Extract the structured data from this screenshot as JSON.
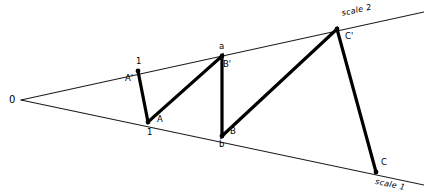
{
  "figure": {
    "background_color": "#ffffff",
    "ink_color": "#000000",
    "width": 424,
    "height": 196
  },
  "origin": {
    "label": "0",
    "x": 21,
    "y": 100
  },
  "scales": [
    {
      "name": "scale-1",
      "label": "scale 1",
      "label_x": 376,
      "label_y": 178,
      "from": {
        "x": 21,
        "y": 100
      },
      "to": {
        "x": 424,
        "y": 185
      }
    },
    {
      "name": "scale-2",
      "label": "scale 2",
      "label_x": 341,
      "label_y": 10,
      "from": {
        "x": 21,
        "y": 100
      },
      "to": {
        "x": 424,
        "y": 12
      }
    }
  ],
  "vertices": [
    {
      "name": "A-prime",
      "x": 138,
      "y": 71,
      "labels": [
        {
          "text": "1",
          "dx": -2,
          "dy": -14
        },
        {
          "text": "A'",
          "dx": -13,
          "dy": 3
        }
      ]
    },
    {
      "name": "A",
      "x": 148,
      "y": 122,
      "labels": [
        {
          "text": "A",
          "dx": 9,
          "dy": -7
        },
        {
          "text": "1",
          "dx": -1,
          "dy": 6
        }
      ]
    },
    {
      "name": "a",
      "x": 222,
      "y": 56,
      "labels": [
        {
          "text": "a",
          "dx": -3,
          "dy": -14
        },
        {
          "text": "B'",
          "dx": 1,
          "dy": 4
        }
      ]
    },
    {
      "name": "b",
      "x": 222,
      "y": 136,
      "labels": [
        {
          "text": "B",
          "dx": 8,
          "dy": -9
        },
        {
          "text": "b",
          "dx": -3,
          "dy": 4
        }
      ]
    },
    {
      "name": "C-prime",
      "x": 337,
      "y": 29,
      "labels": [
        {
          "text": "C'",
          "dx": 8,
          "dy": 3
        }
      ]
    },
    {
      "name": "C",
      "x": 376,
      "y": 172,
      "labels": [
        {
          "text": "C",
          "dx": 5,
          "dy": -14
        }
      ]
    }
  ],
  "zigzag_path": {
    "name": "construction-zigzag",
    "points": [
      {
        "x": 138,
        "y": 71
      },
      {
        "x": 148,
        "y": 122
      },
      {
        "x": 222,
        "y": 56
      },
      {
        "x": 222,
        "y": 136
      },
      {
        "x": 337,
        "y": 29
      },
      {
        "x": 376,
        "y": 172
      },
      {
        "x": 337,
        "y": 29
      }
    ]
  },
  "chart_data": {
    "type": "diagram",
    "origin_label": "0",
    "axis_labels": [
      "scale 1",
      "scale 2"
    ],
    "point_labels": [
      "1",
      "A'",
      "A",
      "1",
      "a",
      "B'",
      "B",
      "b",
      "C'",
      "C"
    ],
    "points": [
      {
        "id": "A'",
        "scale": "scale 2",
        "x": 138,
        "y": 71,
        "division": "1"
      },
      {
        "id": "A",
        "scale": "scale 1",
        "x": 148,
        "y": 122,
        "division": "1"
      },
      {
        "id": "B'",
        "scale": "scale 2",
        "x": 222,
        "y": 56,
        "division": "a"
      },
      {
        "id": "B",
        "scale": "scale 1",
        "x": 222,
        "y": 136,
        "division": "b"
      },
      {
        "id": "C'",
        "scale": "scale 2",
        "x": 337,
        "y": 29,
        "division": ""
      },
      {
        "id": "C",
        "scale": "scale 1",
        "x": 376,
        "y": 172,
        "division": ""
      }
    ]
  }
}
